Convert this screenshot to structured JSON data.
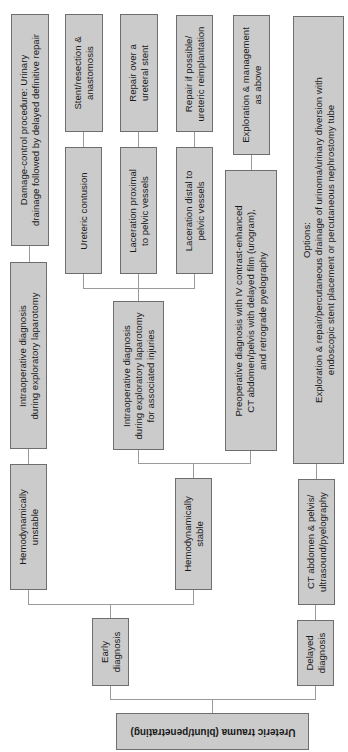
{
  "diagram": {
    "colors": {
      "box_fill": "#cbcbcb",
      "box_border": "#6e6e6e",
      "connector": "#9a9a9a",
      "background": "#ffffff"
    },
    "nodes": {
      "root": "Ureteric trauma (blunt/penetrating)",
      "early": "Early\ndiagnosis",
      "delayed": "Delayed\ndiagnosis",
      "unstable": "Hemodynamically\nunstable",
      "stable": "Hemodynamically\nstable",
      "ct_delayed": "CT abdomen & pelvis/\nultrasound/pyelography",
      "intraop_unstable": "Intraoperative diagnosis\nduring exploratory laparotomy",
      "damage_control": "Damage-control procedure: Urinary\ndrainage followed by delayed definitive repair",
      "intraop_stable": "Intraoperative diagnosis\nduring exploratory laparotomy\nfor associated injuries",
      "preop": "Preoperative diagnosis with IV contrast-enhanced\nCT abdomen/pelvis with delayed film (urogram),\nand retrograde pyelography",
      "exploration": "Exploration & management\nas above",
      "options": "Options:\nExploration & repair/percutaneous drainage of urinoma/urinary diversion with\nendoscopic stent placement or percutaneous nephrostomy tube",
      "contusion": "Ureteric contusion",
      "lac_proximal": "Laceration proximal\nto pelvic vessels",
      "lac_distal": "Laceration distal to\npelvic vessels",
      "stent_resection": "Stent/resection &\nanastomosis",
      "repair_stent": "Repair over a\nureteral stent",
      "repair_reimplant": "Repair if possible/\nureteric reimplantation"
    }
  }
}
